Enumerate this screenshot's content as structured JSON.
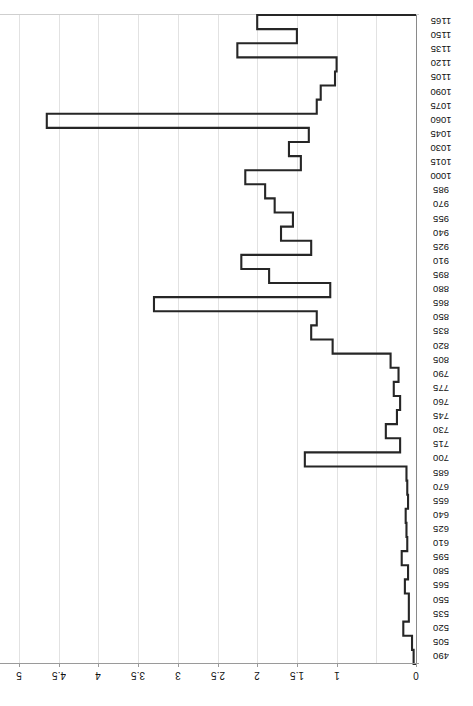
{
  "chart_data": {
    "type": "bar",
    "orientation": "horizontal-step",
    "title": "",
    "subtitle": "",
    "xlabel": "",
    "ylabel": "",
    "grid": true,
    "legend": null,
    "xlim": [
      0,
      5
    ],
    "xticks": [
      "0",
      "1",
      "1.5",
      "2",
      "2.5",
      "3",
      "3.5",
      "4",
      "4.5",
      "5"
    ],
    "xtick_values": [
      0,
      1,
      1.5,
      2,
      2.5,
      3,
      3.5,
      4,
      4.5,
      5
    ],
    "xtick_all_values": [
      0,
      0.5,
      1,
      1.5,
      2,
      2.5,
      3,
      3.5,
      4,
      4.5,
      5
    ],
    "axis_rotated_180": true,
    "categories": [
      "1165",
      "1150",
      "1135",
      "1120",
      "1105",
      "1090",
      "1075",
      "1060",
      "1045",
      "1030",
      "1015",
      "1000",
      "985",
      "970",
      "955",
      "940",
      "925",
      "910",
      "895",
      "880",
      "865",
      "850",
      "835",
      "820",
      "805",
      "790",
      "775",
      "760",
      "745",
      "730",
      "715",
      "700",
      "685",
      "670",
      "655",
      "640",
      "625",
      "610",
      "595",
      "580",
      "565",
      "550",
      "535",
      "520",
      "505",
      "490"
    ],
    "values": [
      2.0,
      1.5,
      2.25,
      1.0,
      1.02,
      1.2,
      1.25,
      4.65,
      1.35,
      1.6,
      1.45,
      2.15,
      1.9,
      1.78,
      1.55,
      1.7,
      1.32,
      2.2,
      1.85,
      1.08,
      3.3,
      1.25,
      1.32,
      1.05,
      0.32,
      0.22,
      0.28,
      0.2,
      0.24,
      0.38,
      0.2,
      1.4,
      0.12,
      0.11,
      0.1,
      0.13,
      0.12,
      0.11,
      0.18,
      0.1,
      0.14,
      0.09,
      0.09,
      0.16,
      0.05,
      0.03
    ]
  },
  "axis": {
    "x_tick_labels": [
      "5",
      "4.5",
      "4",
      "3.5",
      "3",
      "2.5",
      "2",
      "1.5",
      "1",
      "0"
    ],
    "x_tick_positions": [
      5,
      4.5,
      4,
      3.5,
      3,
      2.5,
      2,
      1.5,
      1,
      0
    ]
  },
  "style": {
    "line_color": "#262626",
    "grid_color": "#e2e2e2",
    "axis_color": "#9a9a9a",
    "background": "#ffffff"
  }
}
